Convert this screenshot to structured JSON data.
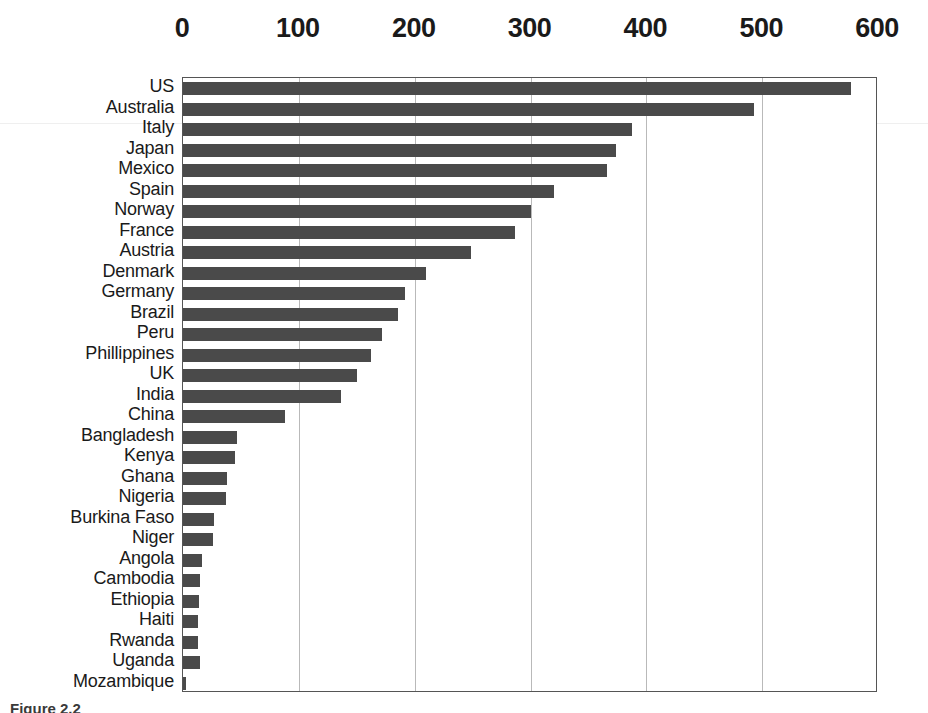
{
  "chart_data": {
    "type": "bar",
    "orientation": "horizontal",
    "title": "",
    "subtitle": "",
    "xlabel": "",
    "ylabel": "",
    "xlim": [
      0,
      600
    ],
    "ylim": null,
    "grid": true,
    "legend": null,
    "legend_position": "none",
    "x_ticks": [
      0,
      100,
      200,
      300,
      400,
      500,
      600
    ],
    "x_tick_labels": [
      "0",
      "100",
      "200",
      "300",
      "400",
      "500",
      "600"
    ],
    "bar_color": "#4a4a4a",
    "plot_border_color": "#555555",
    "gridline_color": "#b9b9b9",
    "background_color": "#ffffff",
    "categories": [
      "US",
      "Australia",
      "Italy",
      "Japan",
      "Mexico",
      "Spain",
      "Norway",
      "France",
      "Austria",
      "Denmark",
      "Germany",
      "Brazil",
      "Peru",
      "Phillippines",
      "UK",
      "India",
      "China",
      "Bangladesh",
      "Kenya",
      "Ghana",
      "Nigeria",
      "Burkina Faso",
      "Niger",
      "Angola",
      "Cambodia",
      "Ethiopia",
      "Haiti",
      "Rwanda",
      "Uganda",
      "Mozambique"
    ],
    "values": [
      577,
      493,
      388,
      374,
      366,
      320,
      300,
      287,
      249,
      210,
      192,
      186,
      172,
      162,
      150,
      136,
      88,
      47,
      45,
      38,
      37,
      27,
      26,
      16,
      15,
      14,
      13,
      13,
      15,
      3
    ]
  },
  "caption": {
    "text": "Figure 2.2"
  }
}
